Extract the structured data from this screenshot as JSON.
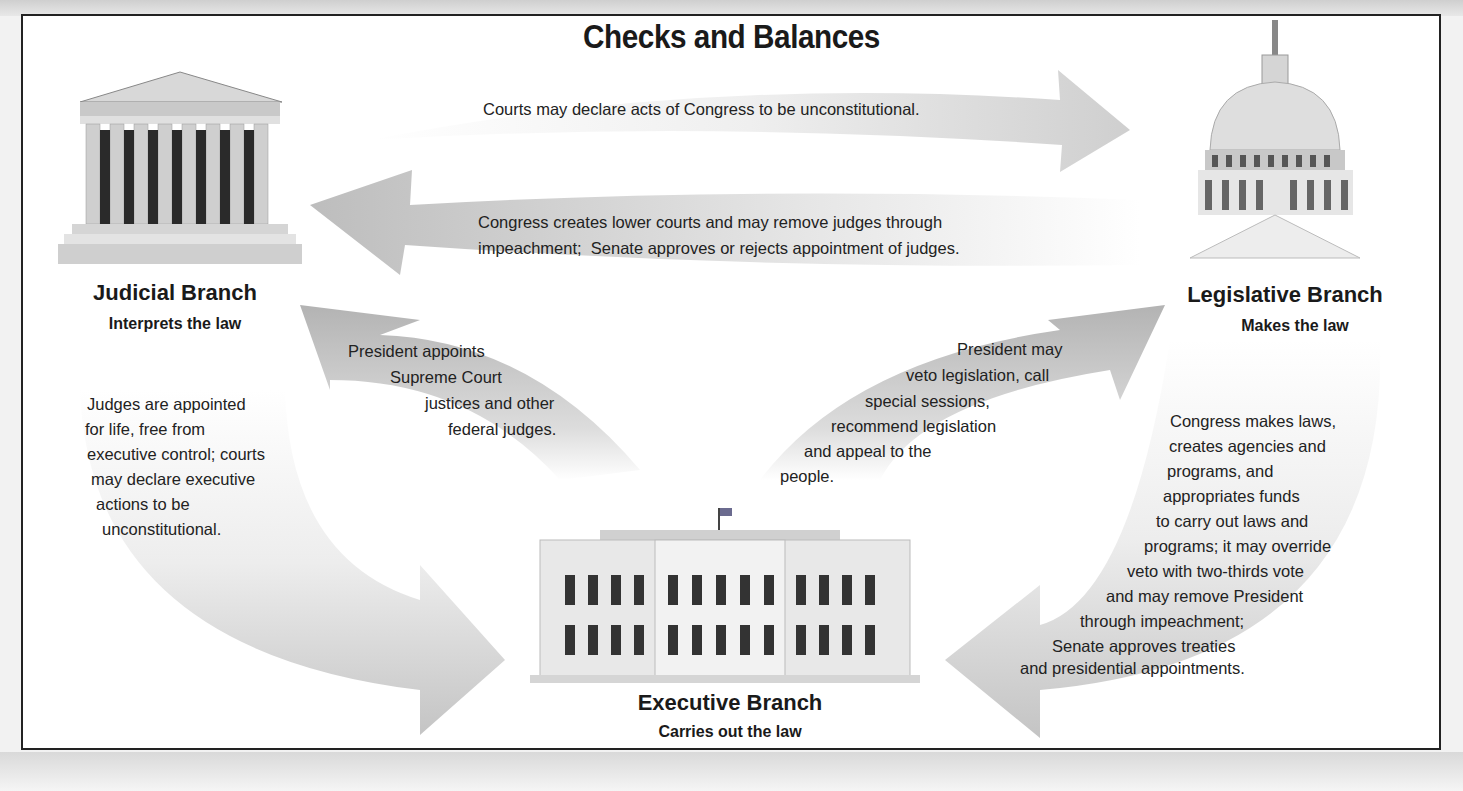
{
  "title": "Checks and Balances",
  "branches": {
    "judicial": {
      "name": "Judicial Branch",
      "role": "Interprets the law",
      "icon": "supreme-court-building"
    },
    "legislative": {
      "name": "Legislative Branch",
      "role": "Makes the law",
      "icon": "capitol-building"
    },
    "executive": {
      "name": "Executive Branch",
      "role": "Carries out the law",
      "icon": "white-house"
    }
  },
  "checks": {
    "judicial_to_legislative": "Courts may declare acts of Congress to be unconstitutional.",
    "legislative_to_judicial": [
      "Congress creates lower courts and may remove judges through",
      "impeachment;  Senate approves or rejects appointment of judges."
    ],
    "executive_to_judicial": [
      "President appoints",
      "Supreme Court",
      "justices and other",
      "federal judges."
    ],
    "executive_to_legislative": [
      "President may",
      "veto legislation, call",
      "special sessions,",
      "recommend legislation",
      "and appeal to the",
      "people."
    ],
    "judicial_to_executive": [
      "Judges are appointed",
      "for life, free from",
      "executive control; courts",
      "may declare executive",
      "actions to be",
      "unconstitutional."
    ],
    "legislative_to_executive": [
      "Congress makes laws,",
      "creates agencies and",
      "programs, and",
      "appropriates funds",
      "to carry out laws and",
      "programs; it may override",
      "veto with two-thirds vote",
      "and may remove President",
      "through impeachment;",
      "Senate approves treaties",
      "and presidential appointments."
    ]
  },
  "colors": {
    "frame": "#222222",
    "arrow_dark": "#b5b5b5",
    "arrow_light": "#ececec",
    "text": "#1a1a1a"
  }
}
